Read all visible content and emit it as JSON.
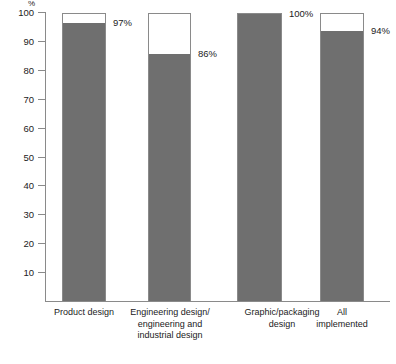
{
  "chart_data": {
    "type": "bar",
    "title": "",
    "xlabel": "",
    "ylabel": "%",
    "ylim": [
      0,
      100
    ],
    "yticks": [
      10,
      20,
      30,
      40,
      50,
      60,
      70,
      80,
      90,
      100
    ],
    "grid": false,
    "legend": null,
    "bar_style": "outlined bar to 100% with gray fill to value",
    "categories": [
      "Product design",
      "Engineering design/\nengineering and\nindustrial design",
      "Graphic/packaging\ndesign",
      "All\nimplemented"
    ],
    "values": [
      97,
      86,
      100,
      94
    ],
    "data_labels": [
      "97%",
      "86%",
      "100%",
      "94%"
    ],
    "colors": {
      "fill": "#6f6f6f",
      "outline": "#8a8a8a",
      "background": "#ffffff",
      "text": "#222222"
    }
  },
  "axis": {
    "unit_label": "%",
    "tick_labels": [
      "100",
      "90",
      "80",
      "70",
      "60",
      "50",
      "40",
      "30",
      "20",
      "10"
    ]
  },
  "bars": [
    {
      "label_lines": [
        "Product design"
      ],
      "value": 97,
      "value_label": "97%"
    },
    {
      "label_lines": [
        "Engineering design/",
        "engineering and",
        "industrial design"
      ],
      "value": 86,
      "value_label": "86%"
    },
    {
      "label_lines": [
        "Graphic/packaging",
        "design"
      ],
      "value": 100,
      "value_label": "100%"
    },
    {
      "label_lines": [
        "All",
        "implemented"
      ],
      "value": 94,
      "value_label": "94%"
    }
  ]
}
